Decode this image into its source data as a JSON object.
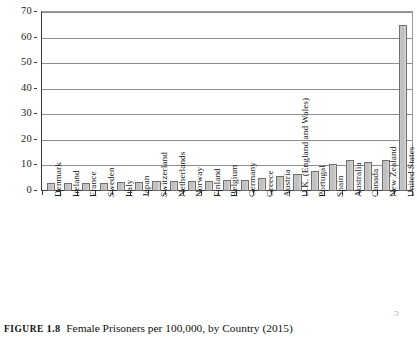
{
  "figure": {
    "caption_label": "FIGURE",
    "caption_number": "1.8",
    "caption_text": "Female Prisoners per 100,000, by Country (2015)",
    "artifact_glyph": "ɔ"
  },
  "chart_data": {
    "type": "bar",
    "title": "Female Prisoners per 100,000, by Country (2015)",
    "xlabel": "",
    "ylabel": "",
    "ylim": [
      0,
      70
    ],
    "yticks": [
      0,
      10,
      20,
      30,
      40,
      50,
      60,
      70
    ],
    "ytick_labels": [
      "0",
      "10",
      "20",
      "30",
      "40",
      "50",
      "60",
      "70"
    ],
    "grid": true,
    "legend": "none",
    "categories": [
      "Denmark",
      "Ireland",
      "France",
      "Sweden",
      "Italy",
      "Japan",
      "Switzerland",
      "Netherlands",
      "Norway",
      "Finland",
      "Belgium",
      "Germany",
      "Greece",
      "Austria",
      "U.K. (England and Wales)",
      "Portugal",
      "Spain",
      "Australia",
      "Canada",
      "New Zealand",
      "United States"
    ],
    "values": [
      3,
      3,
      3,
      3,
      3.5,
      3.5,
      4,
      4,
      4,
      4,
      4.5,
      4.5,
      5,
      6,
      6.5,
      8,
      10.5,
      12,
      11.5,
      12,
      65
    ],
    "bar_color": "#c6c6c6",
    "bar_edge_color": "#6f6f6f"
  }
}
